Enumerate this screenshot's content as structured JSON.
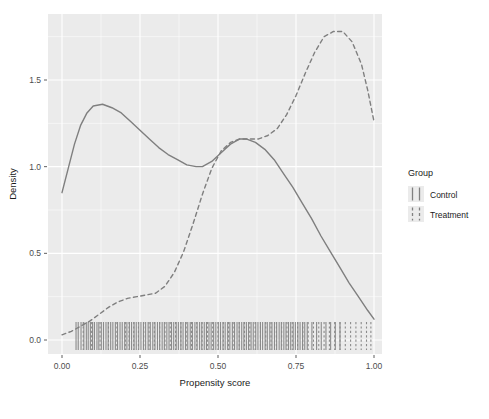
{
  "chart_data": {
    "type": "line",
    "title": "",
    "xlabel": "Propensity score",
    "ylabel": "Density",
    "xlim": [
      0.0,
      1.0
    ],
    "ylim": [
      0.0,
      1.85
    ],
    "grid": true,
    "panel_background": "#ebebeb",
    "grid_color": "#ffffff",
    "legend": {
      "title": "Group",
      "position": "right",
      "entries": [
        {
          "name": "Control",
          "linetype": "solid",
          "color": "#808080"
        },
        {
          "name": "Treatment",
          "linetype": "dashed",
          "color": "#808080"
        }
      ]
    },
    "xticks": [
      "0.00",
      "0.25",
      "0.50",
      "0.75",
      "1.00"
    ],
    "xtick_values": [
      0.0,
      0.25,
      0.5,
      0.75,
      1.0
    ],
    "yticks": [
      "0.0",
      "0.5",
      "1.0",
      "1.5"
    ],
    "ytick_values": [
      0.0,
      0.5,
      1.0,
      1.5
    ],
    "series": [
      {
        "name": "Control",
        "linetype": "solid",
        "color": "#7f7f7f",
        "x": [
          0.0,
          0.02,
          0.04,
          0.06,
          0.08,
          0.1,
          0.13,
          0.16,
          0.19,
          0.22,
          0.25,
          0.28,
          0.31,
          0.34,
          0.37,
          0.4,
          0.43,
          0.45,
          0.48,
          0.51,
          0.54,
          0.57,
          0.59,
          0.62,
          0.65,
          0.68,
          0.71,
          0.74,
          0.77,
          0.8,
          0.83,
          0.86,
          0.89,
          0.92,
          0.95,
          0.98,
          1.0
        ],
        "y": [
          0.85,
          0.99,
          1.13,
          1.24,
          1.31,
          1.35,
          1.36,
          1.34,
          1.31,
          1.26,
          1.21,
          1.16,
          1.11,
          1.07,
          1.04,
          1.01,
          1.0,
          1.0,
          1.03,
          1.08,
          1.13,
          1.16,
          1.16,
          1.14,
          1.1,
          1.04,
          0.96,
          0.88,
          0.79,
          0.7,
          0.6,
          0.51,
          0.42,
          0.33,
          0.25,
          0.17,
          0.12
        ]
      },
      {
        "name": "Treatment",
        "linetype": "dashed",
        "color": "#7f7f7f",
        "x": [
          0.0,
          0.03,
          0.06,
          0.09,
          0.12,
          0.15,
          0.18,
          0.21,
          0.24,
          0.27,
          0.3,
          0.33,
          0.36,
          0.39,
          0.42,
          0.45,
          0.48,
          0.51,
          0.54,
          0.57,
          0.6,
          0.63,
          0.66,
          0.69,
          0.72,
          0.75,
          0.78,
          0.81,
          0.84,
          0.87,
          0.9,
          0.93,
          0.96,
          0.98,
          1.0
        ],
        "y": [
          0.03,
          0.05,
          0.08,
          0.11,
          0.15,
          0.19,
          0.22,
          0.24,
          0.25,
          0.26,
          0.27,
          0.31,
          0.39,
          0.51,
          0.67,
          0.84,
          0.99,
          1.09,
          1.14,
          1.16,
          1.16,
          1.16,
          1.18,
          1.22,
          1.3,
          1.41,
          1.54,
          1.66,
          1.75,
          1.78,
          1.78,
          1.72,
          1.59,
          1.44,
          1.26
        ]
      }
    ],
    "rug": {
      "control_x": [
        0.045,
        0.052,
        0.061,
        0.07,
        0.078,
        0.084,
        0.091,
        0.098,
        0.104,
        0.112,
        0.118,
        0.126,
        0.133,
        0.141,
        0.148,
        0.156,
        0.163,
        0.171,
        0.178,
        0.186,
        0.193,
        0.201,
        0.208,
        0.216,
        0.223,
        0.231,
        0.238,
        0.246,
        0.253,
        0.261,
        0.268,
        0.276,
        0.283,
        0.291,
        0.298,
        0.306,
        0.313,
        0.321,
        0.328,
        0.336,
        0.343,
        0.351,
        0.358,
        0.366,
        0.373,
        0.381,
        0.388,
        0.396,
        0.403,
        0.411,
        0.418,
        0.426,
        0.433,
        0.441,
        0.448,
        0.456,
        0.463,
        0.471,
        0.478,
        0.486,
        0.493,
        0.501,
        0.508,
        0.516,
        0.523,
        0.531,
        0.538,
        0.546,
        0.553,
        0.561,
        0.568,
        0.576,
        0.583,
        0.591,
        0.598,
        0.606,
        0.613,
        0.621,
        0.628,
        0.636,
        0.643,
        0.651,
        0.658,
        0.666,
        0.673,
        0.681,
        0.688,
        0.696,
        0.703,
        0.711,
        0.718,
        0.726,
        0.733,
        0.741,
        0.748,
        0.756,
        0.763,
        0.771,
        0.778,
        0.786,
        0.801,
        0.816,
        0.831,
        0.846,
        0.861,
        0.876,
        0.891
      ],
      "treatment_x": [
        0.068,
        0.095,
        0.122,
        0.149,
        0.176,
        0.203,
        0.215,
        0.23,
        0.245,
        0.262,
        0.279,
        0.296,
        0.313,
        0.33,
        0.347,
        0.364,
        0.381,
        0.398,
        0.415,
        0.432,
        0.449,
        0.466,
        0.483,
        0.5,
        0.517,
        0.534,
        0.551,
        0.568,
        0.585,
        0.602,
        0.619,
        0.636,
        0.653,
        0.67,
        0.687,
        0.704,
        0.721,
        0.738,
        0.755,
        0.772,
        0.789,
        0.806,
        0.823,
        0.84,
        0.857,
        0.874,
        0.891,
        0.908,
        0.925,
        0.942,
        0.959,
        0.976,
        0.99
      ]
    }
  }
}
